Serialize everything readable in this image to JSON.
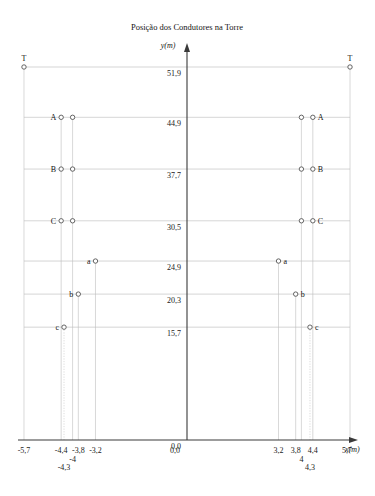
{
  "chart_data": {
    "type": "scatter",
    "title": "Posição dos Condutores na Torre",
    "xlabel": "x(m)",
    "ylabel": "y(m)",
    "xlim": [
      -6.2,
      6.2
    ],
    "ylim": [
      0.0,
      55.0
    ],
    "grid": true,
    "legend": "none",
    "x_ticks": [
      "-5,7",
      "-4,4",
      "-4,3",
      "-4",
      "-3,8",
      "-3,2",
      "0,0",
      "3,2",
      "3,8",
      "4",
      "4,3",
      "4,4",
      "5,7"
    ],
    "x_tick_values": [
      -5.7,
      -4.4,
      -4.3,
      -4.0,
      -3.8,
      -3.2,
      0.0,
      3.2,
      3.8,
      4.0,
      4.3,
      4.4,
      5.7
    ],
    "y_ticks": [
      "51,9",
      "44,9",
      "37,7",
      "30,5",
      "24,9",
      "20,3",
      "15,7",
      "0,0"
    ],
    "y_tick_values": [
      51.9,
      44.9,
      37.7,
      30.5,
      24.9,
      20.3,
      15.7,
      0.0
    ],
    "points": [
      {
        "label": "T",
        "x": -5.7,
        "y": 51.9,
        "side": "left",
        "label_pos": "above"
      },
      {
        "label": "T",
        "x": 5.7,
        "y": 51.9,
        "side": "right",
        "label_pos": "above"
      },
      {
        "label": "A",
        "x": -4.4,
        "y": 44.9,
        "side": "left",
        "label_pos": "left"
      },
      {
        "label": "",
        "x": -4.0,
        "y": 44.9,
        "side": "left",
        "label_pos": "none"
      },
      {
        "label": "",
        "x": 4.0,
        "y": 44.9,
        "side": "right",
        "label_pos": "none"
      },
      {
        "label": "A",
        "x": 4.4,
        "y": 44.9,
        "side": "right",
        "label_pos": "right"
      },
      {
        "label": "B",
        "x": -4.4,
        "y": 37.7,
        "side": "left",
        "label_pos": "left"
      },
      {
        "label": "",
        "x": -4.0,
        "y": 37.7,
        "side": "left",
        "label_pos": "none"
      },
      {
        "label": "",
        "x": 4.0,
        "y": 37.7,
        "side": "right",
        "label_pos": "none"
      },
      {
        "label": "B",
        "x": 4.4,
        "y": 37.7,
        "side": "right",
        "label_pos": "right"
      },
      {
        "label": "C",
        "x": -4.4,
        "y": 30.5,
        "side": "left",
        "label_pos": "left"
      },
      {
        "label": "",
        "x": -4.0,
        "y": 30.5,
        "side": "left",
        "label_pos": "none"
      },
      {
        "label": "",
        "x": 4.0,
        "y": 30.5,
        "side": "right",
        "label_pos": "none"
      },
      {
        "label": "C",
        "x": 4.4,
        "y": 30.5,
        "side": "right",
        "label_pos": "right"
      },
      {
        "label": "a",
        "x": -3.2,
        "y": 24.9,
        "side": "left",
        "label_pos": "left"
      },
      {
        "label": "a",
        "x": 3.2,
        "y": 24.9,
        "side": "right",
        "label_pos": "right"
      },
      {
        "label": "b",
        "x": -3.8,
        "y": 20.3,
        "side": "left",
        "label_pos": "left"
      },
      {
        "label": "b",
        "x": 3.8,
        "y": 20.3,
        "side": "right",
        "label_pos": "right"
      },
      {
        "label": "c",
        "x": -4.3,
        "y": 15.7,
        "side": "left",
        "label_pos": "left"
      },
      {
        "label": "c",
        "x": 4.3,
        "y": 15.7,
        "side": "right",
        "label_pos": "right"
      }
    ],
    "vertical_guides": [
      -5.7,
      -4.4,
      -4.3,
      -4.0,
      -3.8,
      -3.2,
      3.2,
      3.8,
      4.0,
      4.3,
      4.4,
      5.7
    ],
    "vertical_guides_dotted": [
      -4.3,
      4.3
    ],
    "horizontal_guides": [
      51.9,
      44.9,
      37.7,
      30.5,
      24.9,
      20.3,
      15.7
    ]
  }
}
